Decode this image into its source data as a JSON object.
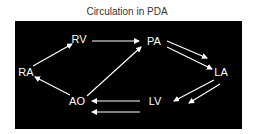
{
  "title": "Circulation in PDA",
  "colors": {
    "background": "#000000",
    "foreground": "#ffffff",
    "title": "#333333"
  },
  "nodes": [
    {
      "id": "RA",
      "label": "RA",
      "x": 11,
      "y": 51
    },
    {
      "id": "RV",
      "label": "RV",
      "x": 64,
      "y": 18
    },
    {
      "id": "PA",
      "label": "PA",
      "x": 139,
      "y": 20
    },
    {
      "id": "LA",
      "label": "LA",
      "x": 206,
      "y": 51
    },
    {
      "id": "LV",
      "label": "LV",
      "x": 140,
      "y": 80
    },
    {
      "id": "AO",
      "label": "AO",
      "x": 62,
      "y": 80
    }
  ],
  "edges": [
    {
      "from": "RA",
      "to": "RV",
      "count": 1
    },
    {
      "from": "RV",
      "to": "PA",
      "count": 1
    },
    {
      "from": "PA",
      "to": "LA",
      "count": 2
    },
    {
      "from": "LA",
      "to": "LV",
      "count": 2
    },
    {
      "from": "LV",
      "to": "AO",
      "count": 2
    },
    {
      "from": "AO",
      "to": "RA",
      "count": 1
    },
    {
      "from": "AO",
      "to": "PA",
      "count": 1
    }
  ]
}
